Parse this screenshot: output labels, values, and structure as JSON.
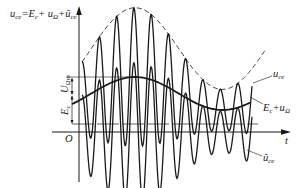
{
  "diagram": {
    "title_formula": {
      "parts": [
        "u",
        "ce",
        "=E",
        "c",
        "+ u",
        "Ω",
        "+ũ",
        "ce"
      ]
    },
    "axes": {
      "y_axis_label": "u_ce = E_c + u_Ω + ũ_ce",
      "x_axis_label": "t",
      "origin_label": "O"
    },
    "annotations": {
      "u_ce_label": {
        "main": "u",
        "sub": "ce"
      },
      "ec_plus_u_omega_label": {
        "main": "E",
        "sub1": "c",
        "plus": "+u",
        "sub2": "Ω"
      },
      "u_tilde_ce_label": {
        "main": "ũ",
        "sub": "ce"
      },
      "u_omega_m_label": {
        "main": "U",
        "sub": "Ωm"
      },
      "e_c_label": {
        "main": "E",
        "sub": "c"
      }
    },
    "colors": {
      "stroke": "#1a1a1a",
      "background": "#ffffff"
    },
    "geometry": {
      "origin_x": 79,
      "axis_y": 132,
      "ec_y": 124,
      "x_start": 82,
      "x_end": 252,
      "carrier_period": 17.3,
      "modulation_center_y": 93.5,
      "modulation_amp": 16.5,
      "modulation_peak_x": 135,
      "modulation_period": 175
    }
  }
}
